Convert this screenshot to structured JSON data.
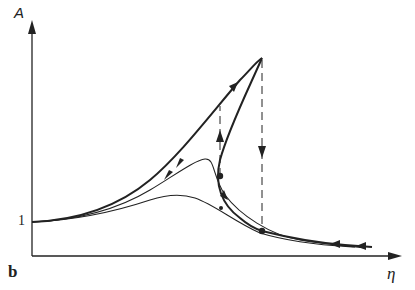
{
  "figure": {
    "panel_label": "b",
    "y_axis_label": "A",
    "x_axis_label": "η",
    "y_tick_label": "1",
    "colors": {
      "ink": "#222222",
      "background": "#ffffff"
    }
  },
  "curves": [
    {
      "name": "low-amplitude-response",
      "style": "thin"
    },
    {
      "name": "medium-amplitude-response",
      "style": "thin"
    },
    {
      "name": "nonlinear-hysteresis-response",
      "style": "thick",
      "features": [
        "upper-branch-to-peak",
        "unstable-middle-branch",
        "jump-down",
        "jump-up"
      ]
    }
  ],
  "annotations": {
    "jump_down": "dashed vertical arrow from peak to lower branch",
    "jump_up": "dashed vertical arrow from lower turning point to upper branch"
  }
}
